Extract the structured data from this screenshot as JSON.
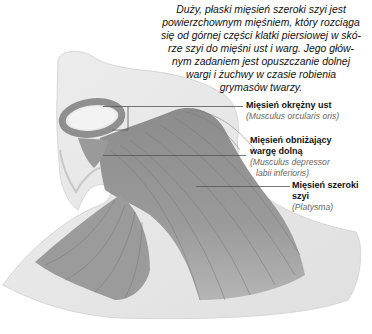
{
  "intro_text": "Duży, płaski mięsień szeroki szyi jest powierzchownym mięśniem, który rozciąga się od górnej części klatki piersiowej w skó-rze szyi do mięśni ust i warg. Jego głów-nym zadaniem jest opuszczanie dolnej wargi i żuchwy w czasie robienia grymasów twarzy.",
  "intro_lines": [
    "Duży, płaski mięsień szeroki szyi jest",
    "powierzchownym mięśniem, który rozciąga",
    "się od górnej części klatki piersiowej w skó-",
    "rze szyi do mięśni ust i warg. Jego głów-",
    "nym zadaniem jest opuszczanie dolnej",
    "wargi i żuchwy w czasie robienia",
    "grymasów twarzy."
  ],
  "labels": [
    {
      "name": "Mięsień okrężny ust",
      "latin": "(Musculus orcularis oris)"
    },
    {
      "name_line1": "Mięsień obniżający",
      "name_line2": "wargę dolną",
      "latin_line1": "(Musculus depressor",
      "latin_line2": "labii inferioris)"
    },
    {
      "name_line1": "Mięsień szeroki",
      "name_line2": "szyi",
      "latin": "(Platysma)"
    }
  ],
  "colors": {
    "skin": "#e6e6e6",
    "skin_edge": "#d2d2d2",
    "muscle_dark": "#8a8a8a",
    "muscle_mid": "#a8a8a8",
    "leader_line": "#555555",
    "text": "#111111",
    "latin_text": "#666666"
  }
}
